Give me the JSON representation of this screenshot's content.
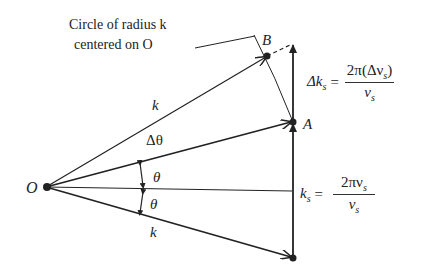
{
  "caption": {
    "line1": "Circle of radius k",
    "line2": "centered on O"
  },
  "points": {
    "origin": "O",
    "A": "A",
    "B": "B"
  },
  "labels": {
    "k_upper": "k",
    "k_lower": "k",
    "delta_theta": "Δθ",
    "theta_upper": "θ",
    "theta_lower": "θ"
  },
  "equations": {
    "delta_ks": {
      "lhs": "Δk",
      "lhs_sub": "s",
      "eq": "=",
      "num": "2π(Δν",
      "num_sub": "s",
      "num_close": ")",
      "den": "v",
      "den_sub": "s"
    },
    "ks": {
      "lhs": "k",
      "lhs_sub": "s",
      "eq": "=",
      "num": "2πν",
      "num_sub": "s",
      "den": "v",
      "den_sub": "s"
    }
  },
  "colors": {
    "ink": "#222222",
    "background": "#ffffff"
  }
}
